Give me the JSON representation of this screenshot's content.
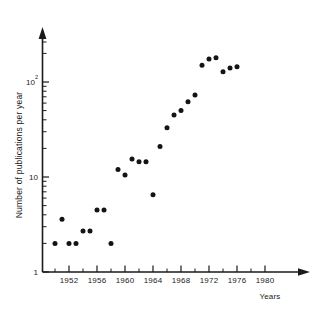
{
  "chart_data": {
    "type": "scatter",
    "title": "",
    "xlabel": "Years",
    "ylabel": "Number of publications per year",
    "yscale": "log",
    "xlim": [
      1949.2,
      1981.5
    ],
    "ylim": [
      1,
      300
    ],
    "grid": false,
    "legend": null,
    "x_ticks": [
      1952,
      1956,
      1960,
      1964,
      1968,
      1972,
      1976,
      1980
    ],
    "x_tick_labels": [
      "1952",
      "1956",
      "1960",
      "1964",
      "1968",
      "1972",
      "1976",
      "1980"
    ],
    "x_minor_ticks": [
      1950,
      1954,
      1958,
      1962,
      1966,
      1970,
      1974,
      1978
    ],
    "y_ticks": [
      1,
      10,
      100
    ],
    "y_tick_labels": [
      "1",
      "10",
      "10²"
    ],
    "y_tick_label_main": [
      "1",
      "10",
      "10"
    ],
    "y_tick_label_exp": [
      "",
      "",
      "2"
    ],
    "points": [
      {
        "x": 1950,
        "y": 2
      },
      {
        "x": 1951,
        "y": 3.6
      },
      {
        "x": 1952,
        "y": 2
      },
      {
        "x": 1953,
        "y": 2
      },
      {
        "x": 1954,
        "y": 2.7
      },
      {
        "x": 1955,
        "y": 2.7
      },
      {
        "x": 1956,
        "y": 4.5
      },
      {
        "x": 1957,
        "y": 4.5
      },
      {
        "x": 1958,
        "y": 2
      },
      {
        "x": 1959,
        "y": 12
      },
      {
        "x": 1960,
        "y": 10.5
      },
      {
        "x": 1961,
        "y": 15.5
      },
      {
        "x": 1962,
        "y": 14.5
      },
      {
        "x": 1963,
        "y": 14.5
      },
      {
        "x": 1964,
        "y": 6.5
      },
      {
        "x": 1965,
        "y": 21
      },
      {
        "x": 1966,
        "y": 33
      },
      {
        "x": 1967,
        "y": 45
      },
      {
        "x": 1968,
        "y": 50
      },
      {
        "x": 1969,
        "y": 62
      },
      {
        "x": 1970,
        "y": 73
      },
      {
        "x": 1971,
        "y": 150
      },
      {
        "x": 1972,
        "y": 175
      },
      {
        "x": 1973,
        "y": 180
      },
      {
        "x": 1974,
        "y": 128
      },
      {
        "x": 1975,
        "y": 140
      },
      {
        "x": 1976,
        "y": 145
      }
    ]
  },
  "axes": {
    "x_title": "Years",
    "y_title": "Number of publications per year"
  }
}
